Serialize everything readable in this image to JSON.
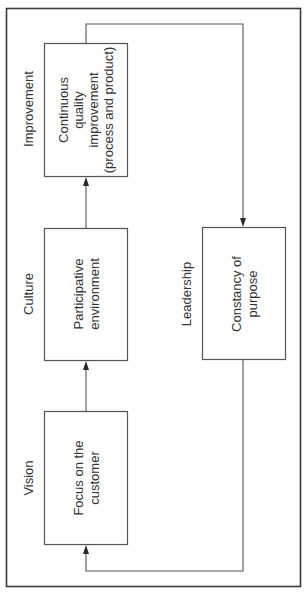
{
  "diagram": {
    "orientation": "rotated-90-ccw",
    "colors": {
      "frame": "#3a3a3a",
      "box_stroke": "#555555",
      "text": "#333333",
      "background": "#ffffff"
    },
    "stages": [
      {
        "id": "vision",
        "category_label": "Vision",
        "box_lines": [
          "Focus on the",
          "customer"
        ]
      },
      {
        "id": "culture",
        "category_label": "Culture",
        "box_lines": [
          "Participative",
          "environment"
        ]
      },
      {
        "id": "improvement",
        "category_label": "Improvement",
        "box_lines": [
          "Continuous",
          "quality",
          "improvement",
          "(process and product)"
        ]
      }
    ],
    "leadership": {
      "category_label": "Leadership",
      "box_lines": [
        "Constancy of",
        "purpose"
      ]
    },
    "flow": [
      {
        "from": "vision",
        "to": "culture"
      },
      {
        "from": "culture",
        "to": "improvement"
      },
      {
        "from": "improvement",
        "to": "leadership"
      },
      {
        "from": "leadership",
        "to": "vision"
      }
    ]
  }
}
